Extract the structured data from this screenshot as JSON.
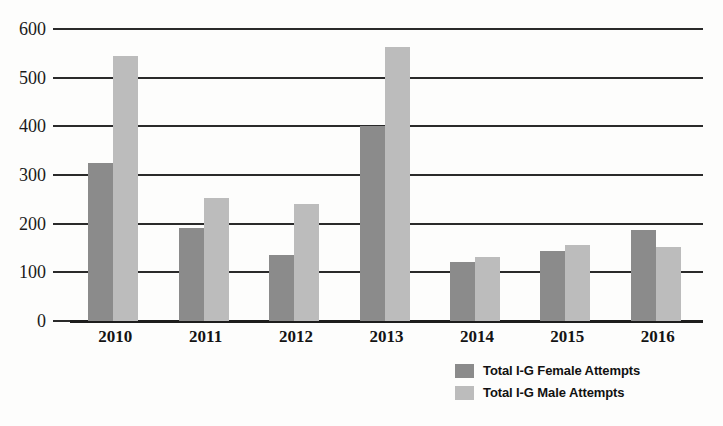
{
  "chart_data": {
    "type": "bar",
    "title": "",
    "xlabel": "",
    "ylabel": "",
    "categories": [
      "2010",
      "2011",
      "2012",
      "2013",
      "2014",
      "2015",
      "2016"
    ],
    "series": [
      {
        "name": "Total I-G Female Attempts",
        "color": "#8b8b8b",
        "values": [
          325,
          192,
          135,
          400,
          122,
          143,
          188
        ]
      },
      {
        "name": "Total I-G Male Attempts",
        "color": "#bcbcbc",
        "values": [
          545,
          253,
          240,
          563,
          131,
          157,
          152
        ]
      }
    ],
    "ylim": [
      0,
      600
    ],
    "ytick_labels": [
      "600",
      "500",
      "400",
      "300",
      "200",
      "100",
      "0"
    ],
    "ytick_values": [
      600,
      500,
      400,
      300,
      200,
      100,
      0
    ],
    "grid": true,
    "legend_position": "bottom-right"
  },
  "legend": {
    "items": [
      {
        "label": "Total I-G Female Attempts",
        "swatch": "female-swatch"
      },
      {
        "label": "Total I-G Male Attempts",
        "swatch": "male-swatch"
      }
    ]
  }
}
